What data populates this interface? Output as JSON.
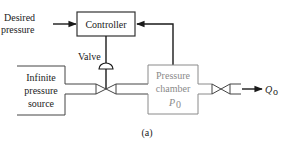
{
  "diagram": {
    "type": "block-diagram",
    "caption": "(a)",
    "nodes": {
      "desired_pressure": {
        "line1": "Desired",
        "line2": "pressure"
      },
      "controller": {
        "label": "Controller"
      },
      "valve": {
        "label": "Valve"
      },
      "source": {
        "line1": "Infinite",
        "line2": "pressure",
        "line3": "source"
      },
      "chamber": {
        "line1": "Pressure",
        "line2": "chamber",
        "symbol": "P",
        "subscript": "0"
      },
      "outflow": {
        "symbol": "Q",
        "subscript": "o"
      }
    },
    "edges": [
      {
        "from": "desired_pressure",
        "to": "controller",
        "arrow": true
      },
      {
        "from": "chamber",
        "to": "controller",
        "arrow": true,
        "label": "feedback"
      },
      {
        "from": "controller",
        "to": "valve",
        "arrow": false
      },
      {
        "from": "source",
        "to": "chamber",
        "via": "valve"
      },
      {
        "from": "chamber",
        "to": "outflow",
        "via": "outlet-valve",
        "arrow": true
      }
    ]
  }
}
